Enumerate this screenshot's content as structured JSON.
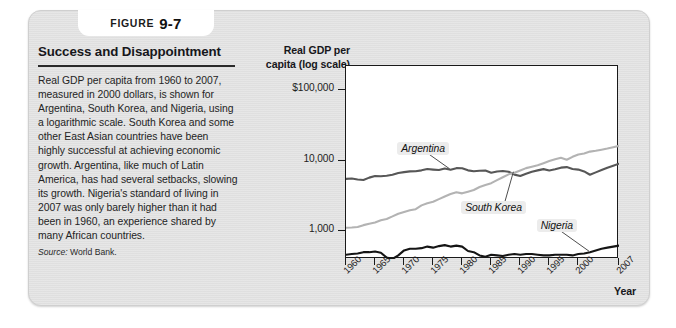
{
  "figure": {
    "tab_word": "Figure",
    "tab_number": "9-7",
    "title": "Success and Disappointment",
    "body": "Real GDP per capita from 1960 to 2007, measured in 2000 dollars, is shown for Argentina, South Korea, and Nigeria, using a logarithmic scale. South Korea and some other East Asian countries have been highly successful at achieving economic growth. Argentina, like much of Latin America, has had several setbacks, slowing its growth. Nigeria's standard of living in 2007 was only barely higher than it had been in 1960, an experience shared by many African countries.",
    "source_label": "Source:",
    "source_value": "World Bank."
  },
  "chart_data": {
    "type": "line",
    "title": "Success and Disappointment",
    "ylabel": "Real GDP per capita (log scale)",
    "xlabel": "Year",
    "y_scale": "log",
    "ytick_labels": [
      "$100,000",
      "10,000",
      "1,000"
    ],
    "ytick_values": [
      100000,
      10000,
      1000
    ],
    "ylim": [
      400,
      220000
    ],
    "grid": false,
    "legend_position": "inline-callout",
    "xlim": [
      1960,
      2007
    ],
    "xtick_labels": [
      "1960",
      "1965",
      "1970",
      "1975",
      "1980",
      "1985",
      "1990",
      "1995",
      "2000",
      "2007"
    ],
    "xtick_values": [
      1960,
      1965,
      1970,
      1975,
      1980,
      1985,
      1990,
      1995,
      2000,
      2007
    ],
    "x": [
      1960,
      1961,
      1962,
      1963,
      1964,
      1965,
      1966,
      1967,
      1968,
      1969,
      1970,
      1971,
      1972,
      1973,
      1974,
      1975,
      1976,
      1977,
      1978,
      1979,
      1980,
      1981,
      1982,
      1983,
      1984,
      1985,
      1986,
      1987,
      1988,
      1989,
      1990,
      1991,
      1992,
      1993,
      1994,
      1995,
      1996,
      1997,
      1998,
      1999,
      2000,
      2001,
      2002,
      2003,
      2004,
      2005,
      2006,
      2007
    ],
    "series": [
      {
        "name": "Argentina",
        "color": "#575757",
        "values": [
          5500,
          5550,
          5380,
          5300,
          5720,
          6030,
          5980,
          6080,
          6280,
          6660,
          6850,
          7020,
          7040,
          7260,
          7570,
          7440,
          7340,
          7700,
          7400,
          7800,
          7760,
          7260,
          7030,
          7150,
          7230,
          6700,
          6990,
          7120,
          6940,
          6310,
          6020,
          6510,
          6950,
          7250,
          7550,
          7230,
          7500,
          7930,
          8070,
          7600,
          7440,
          7000,
          6290,
          6790,
          7320,
          7920,
          8440,
          9010
        ]
      },
      {
        "name": "South Korea",
        "color": "#b3b3b3",
        "values": [
          1110,
          1120,
          1140,
          1210,
          1270,
          1320,
          1420,
          1480,
          1610,
          1760,
          1860,
          1970,
          2040,
          2310,
          2480,
          2600,
          2830,
          3090,
          3350,
          3540,
          3420,
          3610,
          3820,
          4210,
          4500,
          4770,
          5270,
          5800,
          6370,
          6710,
          7240,
          7810,
          8170,
          8580,
          9180,
          9870,
          10450,
          10930,
          10260,
          11290,
          12200,
          12560,
          13400,
          13740,
          14270,
          14810,
          15470,
          16160
        ]
      },
      {
        "name": "Nigeria",
        "color": "#151515",
        "values": [
          460,
          470,
          480,
          500,
          500,
          510,
          490,
          420,
          400,
          450,
          530,
          560,
          560,
          570,
          600,
          580,
          610,
          630,
          600,
          620,
          600,
          520,
          500,
          450,
          430,
          460,
          450,
          440,
          460,
          470,
          460,
          470,
          470,
          460,
          450,
          450,
          460,
          460,
          460,
          450,
          470,
          480,
          500,
          530,
          560,
          580,
          600,
          620
        ]
      }
    ],
    "annotations": [
      {
        "label": "Argentina",
        "x": 1969,
        "y": 18000
      },
      {
        "label": "South Korea",
        "x": 1980,
        "y": 2600
      },
      {
        "label": "Nigeria",
        "x": 1993,
        "y": 1450
      }
    ]
  }
}
